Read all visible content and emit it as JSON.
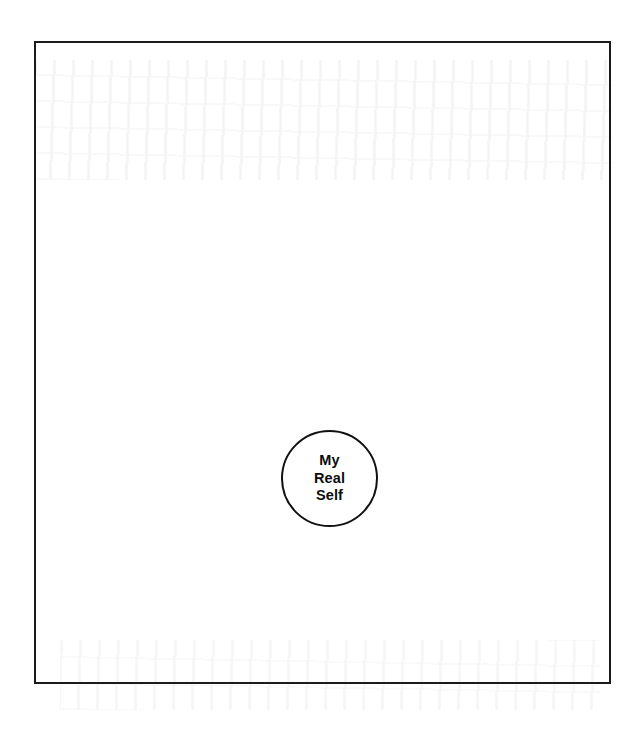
{
  "document": {
    "title": "My Real Self",
    "background_color": "#ffffff",
    "ink_color": "#111111"
  },
  "frame": {
    "name": "outer-boundary-rectangle",
    "border_color": "#1b1b1b",
    "border_width_px": 2,
    "x": 34,
    "y": 41,
    "width": 577,
    "height": 643
  },
  "diagram": {
    "type": "concentric-self-diagram",
    "nodes": [
      {
        "id": "real-self",
        "shape": "circle",
        "center_x": 330,
        "center_y": 479,
        "diameter_px": 97,
        "border_color": "#111111",
        "fill_color": "#ffffff",
        "lines": [
          "My",
          "Real",
          "Self"
        ],
        "line1": "My",
        "line2": "Real",
        "line3": "Self"
      }
    ]
  }
}
